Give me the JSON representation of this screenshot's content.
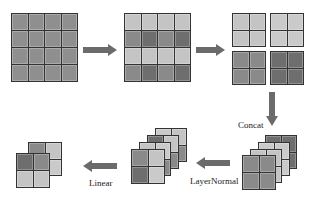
{
  "diagram": {
    "colors": {
      "mid": "#8f8f8f",
      "light": "#c4c4c4",
      "dark": "#707070",
      "darker": "#666666",
      "arrow": "#6b6b6b",
      "border": "#333333"
    },
    "labels": {
      "concat": "Concat",
      "layernorm": "LayerNormal",
      "linear": "Linear"
    },
    "steps": [
      {
        "name": "input-feature-map",
        "grid": "4x4"
      },
      {
        "name": "patch-grouped-map",
        "grid": "4x4"
      },
      {
        "name": "four-sub-maps",
        "grid": "2x2 x4"
      },
      {
        "name": "concatenated-stack",
        "grid": "2x2 x4 stacked"
      },
      {
        "name": "normalized-stack",
        "grid": "2x2 x4 stacked"
      },
      {
        "name": "linear-output",
        "grid": "2x2 x2 stacked"
      }
    ]
  }
}
